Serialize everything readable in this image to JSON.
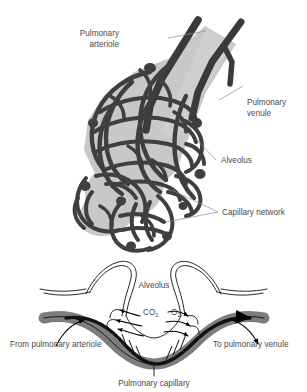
{
  "figure": {
    "background_color": "#ffffff",
    "ink_color": "#3b3b3b",
    "vessel_color": "#3a3a3a",
    "tissue_fill_color": "#c8c8c8",
    "leader_color": "#8d8d8d"
  },
  "upper_panel": {
    "name": "alveolar-sac-illustration",
    "labels": {
      "pulmonary_arteriole": "Pulmonary\narteriole",
      "pulmonary_arteriole_line1": "Pulmonary",
      "pulmonary_arteriole_line2": "arteriole",
      "pulmonary_venule_line1": "Pulmonary",
      "pulmonary_venule_line2": "venule",
      "alveolus": "Alveolus",
      "capillary_network": "Capillary network"
    }
  },
  "lower_panel": {
    "name": "gas-exchange-diagram",
    "labels": {
      "alveolus": "Alveolus",
      "carbon_dioxide_symbol": "CO",
      "carbon_dioxide_subscript": "2",
      "oxygen_symbol": "O",
      "oxygen_subscript": "2",
      "from_pulmonary_arteriole": "From pulmonary arteriole",
      "to_pulmonary_venule": "To pulmonary venule",
      "pulmonary_capillary": "Pulmonary capillary"
    }
  }
}
